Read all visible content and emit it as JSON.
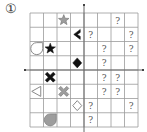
{
  "puzzle_label": "①",
  "grid": {
    "cols": 8,
    "rows": 8,
    "left": 30,
    "top": 13,
    "cell_w": 13.5,
    "cell_h": 14.25,
    "line_color": "#9a9a9a",
    "axis_color": "#666666"
  },
  "unknown_mark": "?",
  "shapes": [
    {
      "row": 1,
      "col": 3,
      "type": "star",
      "style": "gray-filled"
    },
    {
      "row": 2,
      "col": 4,
      "type": "chevron-left",
      "style": "black-filled"
    },
    {
      "row": 3,
      "col": 1,
      "type": "teardrop",
      "style": "gray-outline"
    },
    {
      "row": 3,
      "col": 2,
      "type": "star",
      "style": "black-filled"
    },
    {
      "row": 4,
      "col": 4,
      "type": "diamond",
      "style": "black-filled"
    },
    {
      "row": 5,
      "col": 2,
      "type": "cross",
      "style": "black-filled"
    },
    {
      "row": 6,
      "col": 1,
      "type": "triangle-left",
      "style": "gray-outline"
    },
    {
      "row": 6,
      "col": 3,
      "type": "cross",
      "style": "gray-filled"
    },
    {
      "row": 7,
      "col": 4,
      "type": "diamond",
      "style": "gray-outline"
    },
    {
      "row": 8,
      "col": 2,
      "type": "teardrop",
      "style": "gray-filled"
    }
  ],
  "question_cells": [
    {
      "row": 1,
      "col": 7
    },
    {
      "row": 2,
      "col": 5
    },
    {
      "row": 2,
      "col": 8
    },
    {
      "row": 3,
      "col": 6
    },
    {
      "row": 3,
      "col": 8
    },
    {
      "row": 4,
      "col": 6
    },
    {
      "row": 5,
      "col": 6
    },
    {
      "row": 5,
      "col": 7
    },
    {
      "row": 6,
      "col": 6
    },
    {
      "row": 6,
      "col": 7
    },
    {
      "row": 7,
      "col": 5
    },
    {
      "row": 7,
      "col": 8
    },
    {
      "row": 8,
      "col": 5
    }
  ]
}
